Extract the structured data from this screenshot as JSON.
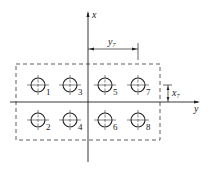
{
  "diagram": {
    "type": "bolt-group-layout",
    "axes": {
      "x_label": "x",
      "y_label": "y"
    },
    "dimensions": {
      "horizontal": {
        "label": "y",
        "subscript": "7"
      },
      "vertical": {
        "label": "x",
        "subscript": "7"
      }
    },
    "bolts": [
      {
        "id": "1",
        "label": "1",
        "cx": 38,
        "cy": 85
      },
      {
        "id": "3",
        "label": "3",
        "cx": 70,
        "cy": 85
      },
      {
        "id": "5",
        "label": "5",
        "cx": 105,
        "cy": 85
      },
      {
        "id": "7",
        "label": "7",
        "cx": 138,
        "cy": 85
      },
      {
        "id": "2",
        "label": "2",
        "cx": 38,
        "cy": 120
      },
      {
        "id": "4",
        "label": "4",
        "cx": 70,
        "cy": 120
      },
      {
        "id": "6",
        "label": "6",
        "cx": 105,
        "cy": 120
      },
      {
        "id": "8",
        "label": "8",
        "cx": 138,
        "cy": 120
      }
    ],
    "colors": {
      "line": "#222222",
      "background": "#ffffff"
    }
  }
}
